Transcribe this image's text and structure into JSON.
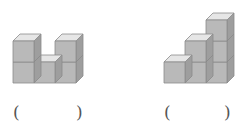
{
  "figures": [
    {
      "name": "figure-left",
      "description": "U-shaped arrangement of 5 unit cubes",
      "columns": [
        2,
        1,
        2
      ],
      "origin_x": 13,
      "blank": {
        "open": "(",
        "close": ")",
        "answer": ""
      }
    },
    {
      "name": "figure-right",
      "description": "Staircase arrangement of 6 unit cubes",
      "columns": [
        1,
        2,
        3
      ],
      "origin_x": 164,
      "blank": {
        "open": "(",
        "close": ")",
        "answer": ""
      }
    }
  ],
  "style": {
    "cube_size": 21,
    "depth": 7,
    "base_y": 83,
    "front_color": "#b9b9b9",
    "top_color": "#e6e6e6",
    "side_color": "#9e9e9e",
    "edge_color": "#8a8a8a"
  }
}
